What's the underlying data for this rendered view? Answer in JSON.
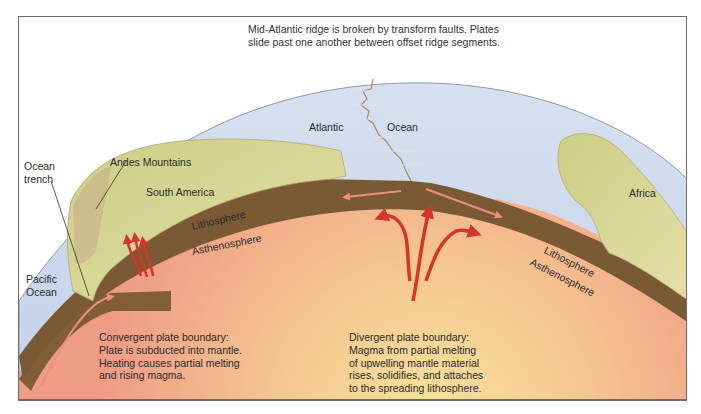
{
  "figure": {
    "top_caption": {
      "line1": "Mid-Atlantic ridge is broken by transform faults. Plates",
      "line2": "slide past one another between offset ridge segments."
    },
    "labels": {
      "atlantic": "Atlantic",
      "ocean": "Ocean",
      "ocean_trench_1": "Ocean",
      "ocean_trench_2": "trench",
      "andes": "Andes Mountains",
      "south_america": "South America",
      "africa": "Africa",
      "pacific_1": "Pacific",
      "pacific_2": "Ocean",
      "lithosphere_left": "Lithosphere",
      "asthenosphere_left": "Asthenosphere",
      "lithosphere_right": "Lithosphere",
      "asthenosphere_right": "Asthenosphere"
    },
    "notes": {
      "convergent": {
        "line1": "Convergent plate boundary:",
        "line2": "Plate is subducted into mantle.",
        "line3": "Heating causes partial melting",
        "line4": "and rising magma."
      },
      "divergent": {
        "line1": "Divergent plate boundary:",
        "line2": "Magma from partial melting",
        "line3": "of upwelling mantle material",
        "line4": "rises, solidifies, and attaches",
        "line5": "to the spreading lithosphere."
      }
    },
    "colors": {
      "ocean": "#c9d6ea",
      "lithosphere": "#7a5a34",
      "asthenosphere": "#f0a88e",
      "mantle_glow": "#f7d998",
      "land": "#d9d69a",
      "arrow_red": "#d8352a",
      "frame": "#6b6b6b"
    }
  }
}
